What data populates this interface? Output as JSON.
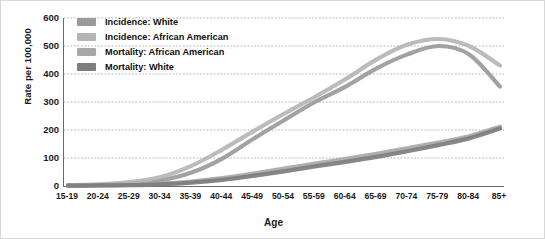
{
  "chart_data": {
    "type": "line",
    "title": "",
    "xlabel": "Age",
    "ylabel": "Rate per 100,000",
    "categories": [
      "15-19",
      "20-24",
      "25-29",
      "30-34",
      "35-39",
      "40-44",
      "45-49",
      "50-54",
      "55-59",
      "60-64",
      "65-69",
      "70-74",
      "75-79",
      "80-84",
      "85+"
    ],
    "ylim": [
      0,
      600
    ],
    "yticks": [
      0,
      100,
      200,
      300,
      400,
      500,
      600
    ],
    "grid": true,
    "grid_style": "dotted-horizontal",
    "legend_position": "top-left",
    "series": [
      {
        "name": "Incidence: White",
        "color": "#9a9a9a",
        "values": [
          2,
          4,
          9,
          20,
          48,
          98,
          168,
          235,
          300,
          355,
          420,
          470,
          500,
          470,
          355
        ]
      },
      {
        "name": "Incidence: African American",
        "color": "#b5b5b5",
        "values": [
          3,
          6,
          14,
          32,
          72,
          130,
          195,
          258,
          318,
          382,
          452,
          505,
          525,
          500,
          430
        ]
      },
      {
        "name": "Mortality: African American",
        "color": "#a8a8a8",
        "values": [
          1,
          2,
          4,
          8,
          16,
          28,
          44,
          62,
          80,
          97,
          115,
          135,
          155,
          178,
          212
        ]
      },
      {
        "name": "Mortality: White",
        "color": "#7d7d7d",
        "values": [
          1,
          2,
          3,
          6,
          12,
          22,
          36,
          52,
          70,
          86,
          104,
          124,
          146,
          170,
          205
        ]
      }
    ]
  },
  "legend": {
    "items": [
      {
        "label": "Incidence: White",
        "color": "#9a9a9a"
      },
      {
        "label": "Incidence: African American",
        "color": "#b5b5b5"
      },
      {
        "label": "Mortality: African American",
        "color": "#a8a8a8"
      },
      {
        "label": "Mortality: White",
        "color": "#7d7d7d"
      }
    ]
  },
  "axes": {
    "y_title": "Rate per 100,000",
    "x_title": "Age",
    "y_tick_labels": [
      "600",
      "500",
      "400",
      "300",
      "200",
      "100",
      "0"
    ],
    "x_tick_labels": [
      "15-19",
      "20-24",
      "25-29",
      "30-34",
      "35-39",
      "40-44",
      "45-49",
      "50-54",
      "55-59",
      "60-64",
      "65-69",
      "70-74",
      "75-79",
      "80-84",
      "85+"
    ]
  },
  "colors": {
    "axis": "#6b6b6b",
    "grid": "#9a9a9a",
    "text": "#1a1a1a",
    "background": "#ffffff"
  }
}
